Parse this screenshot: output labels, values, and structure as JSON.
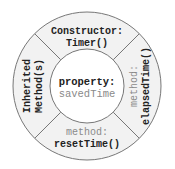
{
  "diagram": {
    "colors": {
      "ring_fill": "#f2f2f2",
      "center_fill": "#ffffff",
      "stroke": "#777777",
      "label_dark": "#222222",
      "label_gray": "#8a8a8a"
    },
    "center": {
      "label": "property:",
      "value": "savedTime"
    },
    "segments": {
      "top": {
        "label": "Constructor:",
        "value": "Timer()"
      },
      "right": {
        "label": "method:",
        "value": "elapsedTime()"
      },
      "bottom": {
        "label": "method:",
        "value": "resetTime()"
      },
      "left": {
        "label": "Inherited",
        "value": "Method(s)"
      }
    }
  }
}
